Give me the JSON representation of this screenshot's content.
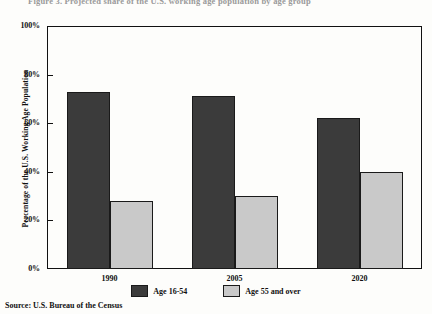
{
  "figure": {
    "top_caption_clipped": "Figure 3.  Projected share of the U.S. working age population by age group",
    "source_note": "Source:  U.S. Bureau of the Census"
  },
  "chart_data": {
    "type": "bar",
    "title": "",
    "xlabel": "",
    "ylabel": "Percentage of the U.S. Working Age Population",
    "categories": [
      "1990",
      "2005",
      "2020"
    ],
    "series": [
      {
        "name": "Age 16-54",
        "color": "#3b3b3b",
        "values": [
          73,
          71,
          62
        ]
      },
      {
        "name": "Age 55 and over",
        "color": "#c9c9c9",
        "values": [
          28,
          30,
          40
        ]
      }
    ],
    "ylim": [
      0,
      100
    ],
    "ytick_labels": [
      "0%",
      "20%",
      "40%",
      "60%",
      "80%",
      "100%"
    ],
    "ytick_values": [
      0,
      20,
      40,
      60,
      80,
      100
    ],
    "grid": false,
    "legend_position": "bottom"
  },
  "legend": {
    "entries": [
      {
        "label": "Age 16-54"
      },
      {
        "label": "Age 55 and over"
      }
    ]
  }
}
